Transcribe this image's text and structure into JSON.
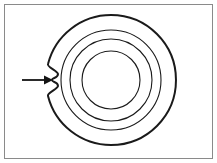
{
  "figure": {
    "title": "Concentric circles with notch indicated by arrow",
    "kind": "line-diagram",
    "background_color": "#ffffff",
    "stroke_color": "#1a1a1a",
    "frame": {
      "name": "image-border",
      "color": "#8a8a8a",
      "inner_color": "#3c3c3c",
      "width_px": 1,
      "x": 4,
      "y": 4,
      "width": 209,
      "height": 155
    },
    "canvas": {
      "width": 217,
      "height": 163
    },
    "circles": [
      {
        "label": "outer-circle",
        "cx": 111,
        "cy": 80,
        "r": 65,
        "stroke_width": 2.0,
        "has_notch": true
      },
      {
        "label": "second-circle",
        "cx": 111,
        "cy": 80,
        "r": 50,
        "stroke_width": 1.1,
        "has_notch": false
      },
      {
        "label": "third-circle",
        "cx": 111,
        "cy": 80,
        "r": 41,
        "stroke_width": 1.1,
        "has_notch": false
      },
      {
        "label": "inner-circle",
        "cx": 111,
        "cy": 80,
        "r": 29,
        "stroke_width": 1.1,
        "has_notch": false
      }
    ],
    "notch": {
      "label": "notch-cusp",
      "description": "small inward cusp on left side of outer circle",
      "angle_deg": 180,
      "depth_px": 6,
      "apex_x": 53,
      "apex_y": 80
    },
    "arrow": {
      "label": "pointer-arrow",
      "direction": "right",
      "tail_x": 22,
      "tip_x": 53,
      "y": 80,
      "shaft_width": 1.8,
      "head_length": 9,
      "head_width": 9,
      "color": "#141414"
    }
  }
}
